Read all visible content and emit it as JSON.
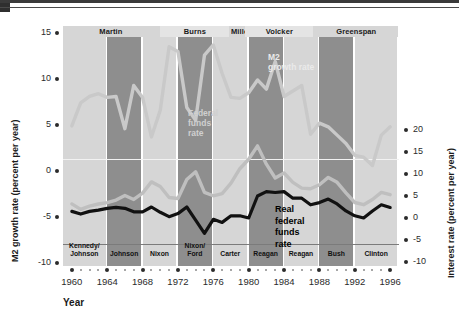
{
  "chart_data": {
    "type": "line",
    "title": "",
    "xlabel": "Year",
    "ylabel_left": "M2 growth rate (percent per year)",
    "ylabel_right": "Interest rate (percent per year)",
    "xlim": [
      1959,
      1997
    ],
    "xticks": [
      1960,
      1964,
      1968,
      1972,
      1976,
      1980,
      1984,
      1988,
      1992,
      1996
    ],
    "xticklabels": [
      "1960",
      "1964",
      "1968",
      "1972",
      "1976",
      "1980",
      "1984",
      "1988",
      "1992",
      "1996"
    ],
    "ylim_left": [
      -10,
      15
    ],
    "yticks_left": [
      15,
      10,
      5,
      0,
      -5,
      -10
    ],
    "yticklabels_left": [
      "15",
      "10",
      "5",
      "0",
      "-5",
      "-10"
    ],
    "ylim_right": [
      -10,
      20
    ],
    "yticks_right": [
      20,
      15,
      10,
      5,
      0,
      -5,
      -10
    ],
    "yticklabels_right": [
      "20",
      "15",
      "10",
      "5",
      "0",
      "-5",
      "-10"
    ],
    "grid": false,
    "legend_position": "in-plot annotations",
    "series": [
      {
        "name": "M2 growth rate",
        "axis": "left",
        "color": "#c9c9c9",
        "annotation": "M2\ngrowth rate",
        "x": [
          1960,
          1961,
          1962,
          1963,
          1964,
          1965,
          1966,
          1967,
          1968,
          1969,
          1970,
          1971,
          1972,
          1973,
          1974,
          1975,
          1976,
          1977,
          1978,
          1979,
          1980,
          1981,
          1982,
          1983,
          1984,
          1985,
          1986,
          1987,
          1988,
          1989,
          1990,
          1991,
          1992,
          1993,
          1994,
          1995,
          1996
        ],
        "values": [
          4.9,
          7.4,
          8.1,
          8.4,
          8.0,
          8.1,
          4.6,
          9.3,
          8.0,
          3.7,
          6.6,
          13.5,
          13.0,
          6.9,
          5.5,
          12.6,
          13.7,
          10.6,
          8.0,
          7.9,
          8.5,
          9.9,
          8.9,
          11.9,
          8.1,
          8.7,
          9.3,
          4.0,
          5.2,
          4.8,
          3.9,
          3.0,
          1.7,
          1.5,
          0.6,
          3.9,
          4.8
        ]
      },
      {
        "name": "Federal funds rate",
        "axis": "right",
        "color": "#bfbfbf",
        "annotation": "Federal\nfunds\nrate",
        "x": [
          1960,
          1961,
          1962,
          1963,
          1964,
          1965,
          1966,
          1967,
          1968,
          1969,
          1970,
          1971,
          1972,
          1973,
          1974,
          1975,
          1976,
          1977,
          1978,
          1979,
          1980,
          1981,
          1982,
          1983,
          1984,
          1985,
          1986,
          1987,
          1988,
          1989,
          1990,
          1991,
          1992,
          1993,
          1994,
          1995,
          1996
        ],
        "values": [
          3.2,
          1.96,
          2.68,
          3.18,
          3.5,
          4.07,
          5.11,
          4.22,
          5.66,
          8.21,
          7.17,
          4.67,
          4.44,
          8.74,
          10.51,
          5.82,
          5.05,
          5.54,
          7.94,
          11.2,
          13.35,
          16.39,
          12.24,
          9.09,
          10.23,
          8.1,
          6.8,
          6.66,
          7.57,
          9.22,
          8.1,
          5.69,
          3.52,
          3.02,
          4.21,
          5.83,
          5.3
        ]
      },
      {
        "name": "Real federal funds rate",
        "axis": "right",
        "color": "#111111",
        "annotation": "Real\nfederal\nfunds\nrate",
        "x": [
          1960,
          1961,
          1962,
          1963,
          1964,
          1965,
          1966,
          1967,
          1968,
          1969,
          1970,
          1971,
          1972,
          1973,
          1974,
          1975,
          1976,
          1977,
          1978,
          1979,
          1980,
          1981,
          1982,
          1983,
          1984,
          1985,
          1986,
          1987,
          1988,
          1989,
          1990,
          1991,
          1992,
          1993,
          1994,
          1995,
          1996
        ],
        "values": [
          1.5,
          0.9,
          1.5,
          1.8,
          2.2,
          2.4,
          2.2,
          1.4,
          1.4,
          2.5,
          1.3,
          0.3,
          1.0,
          2.5,
          -0.5,
          -3.5,
          -0.3,
          -1.0,
          0.5,
          0.5,
          0.0,
          5.0,
          6.0,
          5.8,
          6.0,
          4.5,
          4.5,
          3.0,
          3.5,
          4.3,
          3.2,
          1.6,
          0.5,
          0.0,
          1.6,
          3.0,
          2.4
        ]
      }
    ],
    "fed_chairs": [
      {
        "name": "Martin",
        "start": 1959.0,
        "end": 1970.0
      },
      {
        "name": "Burns",
        "start": 1970.0,
        "end": 1978.0
      },
      {
        "name": "Miller",
        "start": 1978.0,
        "end": 1979.6
      },
      {
        "name": "Volcker",
        "start": 1979.6,
        "end": 1987.5
      },
      {
        "name": "Greenspan",
        "start": 1987.5,
        "end": 1997.0
      }
    ],
    "presidents": [
      {
        "name": "Kennedy/\nJohnson",
        "start": 1959.0,
        "end": 1964.0,
        "shade": "light"
      },
      {
        "name": "Johnson",
        "start": 1964.0,
        "end": 1968.0,
        "shade": "dark"
      },
      {
        "name": "Nixon",
        "start": 1968.0,
        "end": 1972.0,
        "shade": "light"
      },
      {
        "name": "Nixon/\nFord",
        "start": 1972.0,
        "end": 1976.0,
        "shade": "dark"
      },
      {
        "name": "Carter",
        "start": 1976.0,
        "end": 1980.0,
        "shade": "light"
      },
      {
        "name": "Reagan",
        "start": 1980.0,
        "end": 1984.0,
        "shade": "dark"
      },
      {
        "name": "Reagan",
        "start": 1984.0,
        "end": 1988.0,
        "shade": "light"
      },
      {
        "name": "Bush",
        "start": 1988.0,
        "end": 1992.0,
        "shade": "dark"
      },
      {
        "name": "Clinton",
        "start": 1992.0,
        "end": 1997.0,
        "shade": "light"
      }
    ],
    "colors": {
      "band_light": "#d6d6d6",
      "band_dark": "#8e8e8e",
      "m2_line": "#c9c9c9",
      "ffr_line": "#bfbfbf",
      "real_ffr_line": "#111111",
      "zero_line": "#7b7b7b",
      "text": "#1a1a1a"
    }
  }
}
